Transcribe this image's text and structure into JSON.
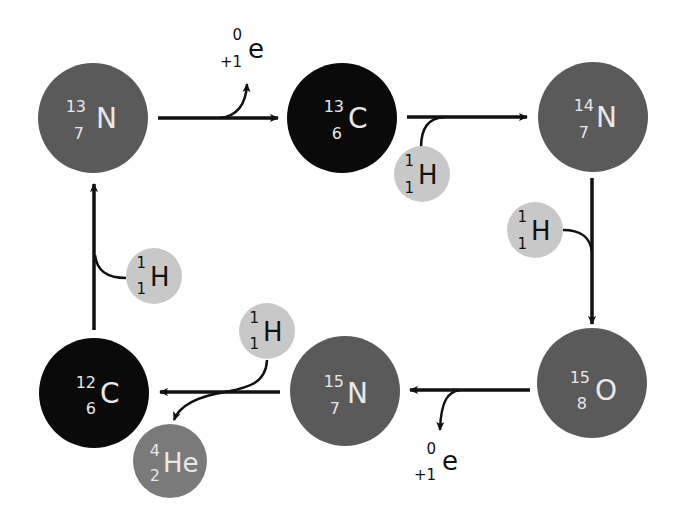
{
  "diagram": {
    "colors": {
      "nitrogen": "#5a5a5a",
      "oxygen": "#5a5a5a",
      "carbon": "#0a0a0a",
      "hydrogen": "#c8c8c8",
      "helium": "#7a7a7a",
      "arrow": "#111111",
      "light_text": "#e8e8e8",
      "dark_text": "#111111"
    },
    "nuclei": [
      {
        "id": "n13",
        "symbol": "N",
        "mass": "13",
        "atomic": "7"
      },
      {
        "id": "c13",
        "symbol": "C",
        "mass": "13",
        "atomic": "6"
      },
      {
        "id": "n14",
        "symbol": "N",
        "mass": "14",
        "atomic": "7"
      },
      {
        "id": "o15",
        "symbol": "O",
        "mass": "15",
        "atomic": "8"
      },
      {
        "id": "n15",
        "symbol": "N",
        "mass": "15",
        "atomic": "7"
      },
      {
        "id": "c12",
        "symbol": "C",
        "mass": "12",
        "atomic": "6"
      },
      {
        "id": "he4",
        "symbol": "He",
        "mass": "4",
        "atomic": "2"
      }
    ],
    "protons": [
      {
        "symbol": "H",
        "mass": "1",
        "atomic": "1"
      },
      {
        "symbol": "H",
        "mass": "1",
        "atomic": "1"
      },
      {
        "symbol": "H",
        "mass": "1",
        "atomic": "1"
      },
      {
        "symbol": "H",
        "mass": "1",
        "atomic": "1"
      }
    ],
    "positrons": [
      {
        "symbol": "e",
        "mass": "0",
        "charge": "+1"
      },
      {
        "symbol": "e",
        "mass": "0",
        "charge": "+1"
      }
    ]
  }
}
